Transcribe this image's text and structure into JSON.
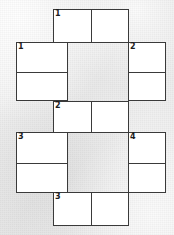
{
  "puzzle": {
    "title": "Crossword-style answer grid",
    "background_color": "#e9e9e9",
    "box_fill_color": "#ffffff",
    "line_color": "#3a3a3a",
    "boxes": [
      {
        "id": "box-top",
        "position": "top",
        "orientation": "horizontal",
        "cells": 2,
        "clue_number": "1",
        "cell_values": [
          "",
          ""
        ]
      },
      {
        "id": "box-left-upper",
        "position": "left-upper",
        "orientation": "vertical",
        "cells": 2,
        "clue_number": "1",
        "cell_values": [
          "",
          ""
        ]
      },
      {
        "id": "box-right-upper",
        "position": "right-upper",
        "orientation": "vertical",
        "cells": 2,
        "clue_number": "2",
        "cell_values": [
          "",
          ""
        ]
      },
      {
        "id": "box-middle",
        "position": "middle",
        "orientation": "horizontal",
        "cells": 2,
        "clue_number": "2",
        "cell_values": [
          "",
          ""
        ]
      },
      {
        "id": "box-left-lower",
        "position": "left-lower",
        "orientation": "vertical",
        "cells": 2,
        "clue_number": "3",
        "cell_values": [
          "",
          ""
        ]
      },
      {
        "id": "box-right-lower",
        "position": "right-lower",
        "orientation": "vertical",
        "cells": 2,
        "clue_number": "4",
        "cell_values": [
          "",
          ""
        ]
      },
      {
        "id": "box-bottom",
        "position": "bottom",
        "orientation": "horizontal",
        "cells": 2,
        "clue_number": "3",
        "cell_values": [
          "",
          ""
        ]
      }
    ]
  }
}
